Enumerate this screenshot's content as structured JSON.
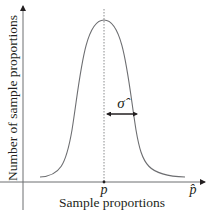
{
  "diagram": {
    "type": "normal-distribution-curve",
    "y_axis_label": "Number of sample proportions",
    "x_axis_label": "Sample proportions",
    "x_axis_end_label": "p̂",
    "center_label": "p",
    "spread_label": "σ̂",
    "colors": {
      "axis": "#6d6e71",
      "curve": "#6d6e71",
      "text": "#231f20",
      "dotted_line": "#6d6e71"
    }
  }
}
